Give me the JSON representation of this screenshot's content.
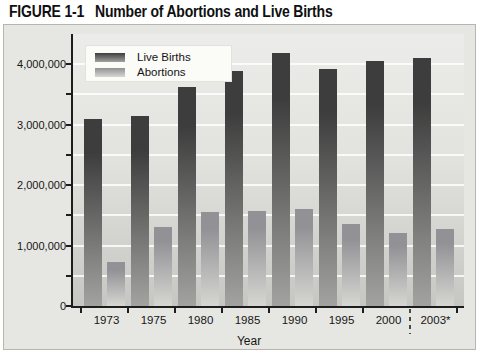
{
  "figure": {
    "label": "FIGURE 1-1",
    "title": "Number of Abortions and Live Births"
  },
  "chart_data": {
    "type": "bar",
    "title": "Number of Abortions and Live Births",
    "categories": [
      "1973",
      "1975",
      "1980",
      "1985",
      "1990",
      "1995",
      "2000",
      "2003*"
    ],
    "series": [
      {
        "name": "Live Births",
        "values": [
          3100000,
          3150000,
          3620000,
          3890000,
          4190000,
          3920000,
          4050000,
          4100000
        ],
        "color_top": "#3d3d3d",
        "color_bottom": "#a2a2a0"
      },
      {
        "name": "Abortions",
        "values": [
          720000,
          1300000,
          1550000,
          1570000,
          1600000,
          1360000,
          1200000,
          1280000
        ],
        "color_top": "#929296",
        "color_bottom": "#d6d6d2"
      }
    ],
    "xlabel": "Year",
    "ylabel": "",
    "ylim": [
      0,
      4500000
    ],
    "ytick_major_interval": 1000000,
    "ytick_minor_interval": 500000,
    "ytick_labels": [
      {
        "label": "0",
        "value": 0
      },
      {
        "label": "1,000,000",
        "value": 1000000
      },
      {
        "label": "2,000,000",
        "value": 2000000
      },
      {
        "label": "3,000,000",
        "value": 3000000
      },
      {
        "label": "4,000,000",
        "value": 4000000
      }
    ],
    "grid": true,
    "legend_position": "top-left",
    "dashed_divider_before_category": "2003*"
  }
}
